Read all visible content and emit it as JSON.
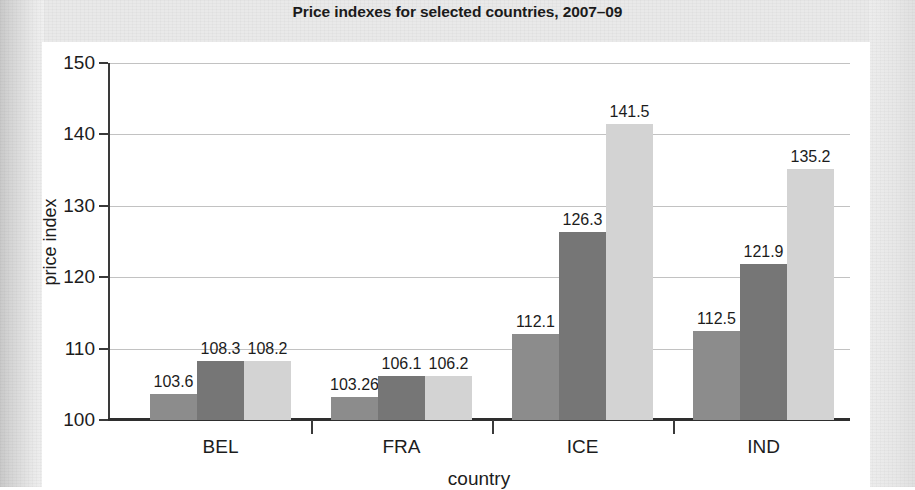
{
  "chart_data": {
    "type": "bar",
    "title": "Price indexes for selected countries, 2007–09",
    "xlabel": "country",
    "ylabel": "price index",
    "ylim": [
      100,
      150
    ],
    "ytick_labels": [
      "150",
      "140",
      "130",
      "120",
      "110",
      "100"
    ],
    "yticks": [
      150,
      140,
      130,
      120,
      110,
      100
    ],
    "grid": true,
    "legend": "none",
    "categories": [
      "BEL",
      "FRA",
      "ICE",
      "IND"
    ],
    "series": [
      {
        "name": "2007",
        "color": "#8c8c8c",
        "values": [
          103.6,
          103.26,
          112.1,
          112.5
        ],
        "labels": [
          "103.6",
          "103.26",
          "112.1",
          "112.5"
        ]
      },
      {
        "name": "2008",
        "color": "#767676",
        "values": [
          108.3,
          106.1,
          126.3,
          121.9
        ],
        "labels": [
          "108.3",
          "106.1",
          "126.3",
          "121.9"
        ]
      },
      {
        "name": "2009",
        "color": "#d3d3d3",
        "values": [
          108.2,
          106.2,
          141.5,
          135.2
        ],
        "labels": [
          "108.2",
          "106.2",
          "141.5",
          "135.2"
        ]
      }
    ]
  },
  "colors": {
    "page_background": "#e9e9e9",
    "panel_background": "#ffffff",
    "axis": "#2e2e2e",
    "gridline": "#c2c2c2",
    "text": "#1c1c1c"
  }
}
